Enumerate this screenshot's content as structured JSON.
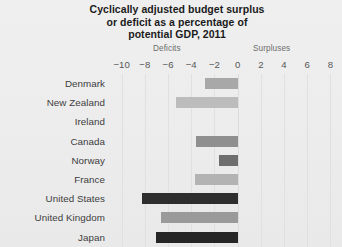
{
  "chart_data": {
    "type": "bar",
    "orientation": "horizontal",
    "title": "Cyclically adjusted budget surplus or deficit as a percentage of potential GDP, 2011",
    "title_lines": [
      "Cyclically adjusted budget surplus",
      "or deficit as a percentage of",
      "potential GDP, 2011"
    ],
    "categories": [
      "Denmark",
      "New Zealand",
      "Ireland",
      "Canada",
      "Norway",
      "France",
      "United States",
      "United Kingdom",
      "Japan"
    ],
    "values": [
      -2.8,
      -5.3,
      0,
      -3.6,
      -1.6,
      -3.7,
      -8.2,
      -6.6,
      -7.0
    ],
    "bar_colors": [
      "#a8a8a8",
      "#bcbcbc",
      "#cfcfcf",
      "#8f8f8f",
      "#6e6e6e",
      "#b3b3b3",
      "#2e2e2e",
      "#9a9a9a",
      "#262626"
    ],
    "xlabel": "",
    "ylabel": "",
    "xlim": [
      -11,
      9
    ],
    "xticks": [
      -10,
      -8,
      -6,
      -4,
      -2,
      0,
      2,
      4,
      6,
      8
    ],
    "xtick_labels": [
      "−10",
      "−8",
      "−6",
      "−4",
      "−2",
      "0",
      "2",
      "4",
      "6",
      "8"
    ],
    "axis_annotations": {
      "negative_side": "Deficits",
      "positive_side": "Surpluses"
    },
    "grid": true,
    "grid_axis": "x",
    "legend": null,
    "background_color": "#ececec",
    "text_color": "#3d3d3d"
  }
}
